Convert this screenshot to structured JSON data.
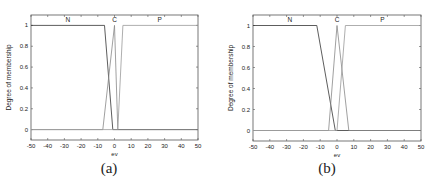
{
  "chart_data": [
    {
      "type": "line",
      "caption": "(a)",
      "title": "",
      "xlabel": "ev",
      "ylabel": "Degree of membership",
      "xlim": [
        -50,
        50
      ],
      "ylim": [
        -0.1,
        1.1
      ],
      "xticks": [
        -50,
        -40,
        -30,
        -20,
        -10,
        0,
        10,
        20,
        30,
        40,
        50
      ],
      "yticks": [
        0,
        0.2,
        0.4,
        0.6,
        0.8,
        1
      ],
      "ytick_labels": [
        "0",
        "0.2",
        "0.4",
        "0.6",
        "0.8",
        "1"
      ],
      "grid": false,
      "legend": "none",
      "series": [
        {
          "name": "N",
          "label_x": -28,
          "x": [
            -50,
            -6,
            -1,
            50
          ],
          "y": [
            1,
            1,
            0,
            0
          ]
        },
        {
          "name": "C",
          "label_x": 0,
          "x": [
            -50,
            -7,
            0,
            2,
            50
          ],
          "y": [
            0,
            0,
            1,
            0,
            0
          ]
        },
        {
          "name": "P",
          "label_x": 27,
          "x": [
            -50,
            2,
            5,
            50
          ],
          "y": [
            0,
            0,
            1,
            1
          ]
        }
      ]
    },
    {
      "type": "line",
      "caption": "(b)",
      "title": "",
      "xlabel": "ev",
      "ylabel": "Degree of membership",
      "xlim": [
        -50,
        50
      ],
      "ylim": [
        -0.1,
        1.1
      ],
      "xticks": [
        -50,
        -40,
        -30,
        -20,
        -10,
        0,
        10,
        20,
        30,
        40,
        50
      ],
      "yticks": [
        0,
        0.2,
        0.4,
        0.6,
        0.8,
        1
      ],
      "ytick_labels": [
        "0",
        "0.2",
        "0.4",
        "0.6",
        "0.8",
        "1"
      ],
      "grid": false,
      "legend": "none",
      "series": [
        {
          "name": "N",
          "label_x": -28,
          "x": [
            -50,
            -12,
            -1,
            50
          ],
          "y": [
            1,
            1,
            0,
            0
          ]
        },
        {
          "name": "C",
          "label_x": 0,
          "x": [
            -50,
            -5,
            0,
            7,
            50
          ],
          "y": [
            0,
            0,
            1,
            0,
            0
          ]
        },
        {
          "name": "P",
          "label_x": 27,
          "x": [
            -50,
            0,
            5,
            50
          ],
          "y": [
            0,
            0,
            1,
            1
          ]
        }
      ]
    }
  ],
  "panels": [
    {
      "caption": "(a)",
      "xlabel": "ev",
      "ylabel": "Degree of membership"
    },
    {
      "caption": "(b)",
      "xlabel": "ev",
      "ylabel": "Degree of membership"
    }
  ],
  "colors": {
    "frame": "#555555",
    "N": "#333333",
    "C": "#888888",
    "P": "#999999",
    "text": "#222222"
  }
}
